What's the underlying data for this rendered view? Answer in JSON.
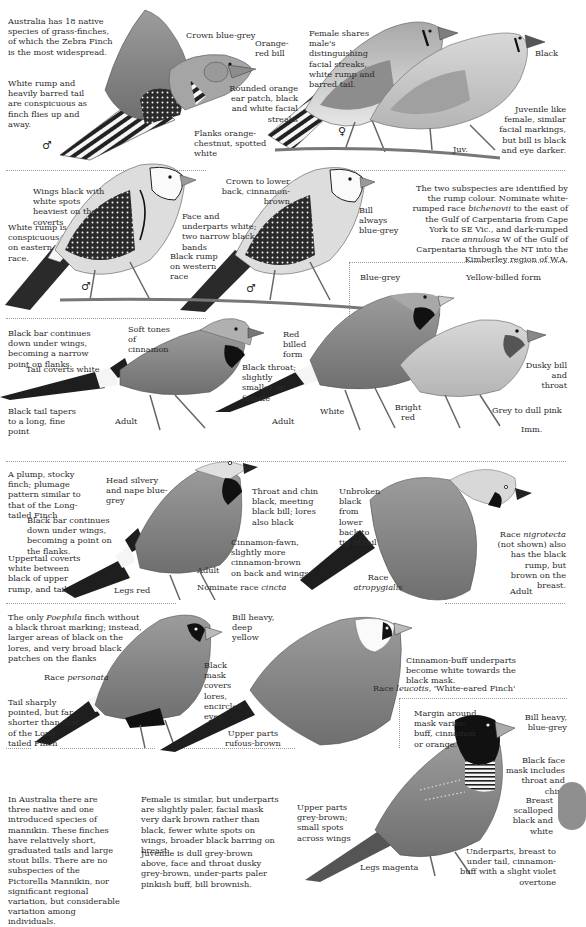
{
  "page": {
    "colors": {
      "background": "#ffffff",
      "text": "#2b2b2b",
      "divider": "#9a9a9a",
      "side_tab": "#8f8f8f",
      "ink_dark": "#1c1c1c",
      "ink_mid": "#8a8a8a",
      "ink_light": "#c9c9c9"
    }
  },
  "zebra": {
    "intro": "Australia has 18 native species of grass-finches, of which the Zebra Finch is the most widespread.",
    "rump_note": "White rump and heavily barred tail are conspicuous as finch flies up and away.",
    "crown": "Crown blue-grey",
    "bill": "Orange-red bill",
    "ear": "Rounded orange ear patch, black and white facial streaks",
    "flanks": "Flanks orange-chestnut, spotted white",
    "male_symbol": "♂",
    "female_note": "Female shares male's distinguishing facial streaks, white rump and barred tail.",
    "black": "Black",
    "juvenile_note": "Juvenile like female, similar facial markings, but bill is black and eye darker.",
    "female_symbol": "♀",
    "juv_label": "Juv."
  },
  "double_barred": {
    "wings": "Wings black with white spots heaviest on the coverts",
    "white_rump": "White rump is conspicuous on eastern race.",
    "face": "Face and underparts white; two narrow black bands",
    "black_rump": "Black rump on western race",
    "crown": "Crown to lower back, cinnamon-brown",
    "bill": "Bill always blue-grey",
    "male_symbol_1": "♂",
    "male_symbol_2": "♂",
    "subspecies_note_1": "The two subspecies are identified by the rump colour. Nominate white-rumped race ",
    "subspecies_race_1": "bichenovii",
    "subspecies_note_2": " to the east of the Gulf of Carpentaria from Cape York to SE Vic., and dark-rumped race ",
    "subspecies_race_2": "annulosa",
    "subspecies_note_3": " W of the Gulf of Carpentaria through the NT into the Kimberley region of W.A."
  },
  "long_tailed": {
    "black_bar": "Black bar continues down under wings, becoming a narrow point on flanks.",
    "soft_tones": "Soft tones of cinnamon",
    "red_billed": "Red billed form",
    "tail_coverts": "Tail coverts white",
    "black_throat": "Black throat; slightly smaller on female",
    "black_tail": "Black tail tapers to a long, fine point",
    "adult_1": "Adult",
    "blue_grey": "Blue-grey",
    "yellow_billed": "Yellow-billed form",
    "dusky": "Dusky bill and throat",
    "white": "White",
    "adult_2": "Adult",
    "bright_red": "Bright red",
    "grey_pink": "Grey to dull pink",
    "imm": "Imm."
  },
  "black_throated": {
    "intro": "A plump, stocky finch; plumage pattern similar to that of the Long-tailed Finch",
    "head": "Head silvery and nape blue-grey",
    "throat": "Throat and chin black, meeting black bill; lores also black",
    "black_bar": "Black bar continues down under wings, becoming a point on the flanks.",
    "cinnamon": "Cinnamon-fawn, slightly more cinnamon-brown on back and wings",
    "uppertail": "Uppertail coverts white between black of upper rump, and tail",
    "adult": "Adult",
    "legs": "Legs red",
    "nominate_prefix": "Nominate race ",
    "nominate_race": "cincta",
    "unbroken": "Unbroken black from lower back to tip of tail",
    "race_label": "Race",
    "race_name": "atropygialis",
    "nigrotecta_prefix": "Race ",
    "nigrotecta_name": "nigrotecta",
    "nigrotecta_note": " (not shown) also has the black rump, but brown on the breast.",
    "adult_flight": "Adult"
  },
  "masked": {
    "intro_prefix": "The only ",
    "intro_genus": "Poephila",
    "intro_rest": " finch without a black throat marking; instead, larger areas of black on the lores, and very broad black patches on the flanks",
    "bill": "Bill heavy, deep yellow",
    "race_prefix": "Race ",
    "race_name": "personata",
    "mask": "Black mask covers lores, encircles eyes.",
    "tail": "Tail sharply pointed, but far shorter than that of the Long-tailed Finch",
    "upper_parts": "Upper parts rufous-brown",
    "cinnamon_buff": "Cinnamon-buff underparts become white towards the black mask.",
    "leucotis_prefix": "Race ",
    "leucotis_name": "leucotis",
    "leucotis_rest": ", 'White-eared Finch'"
  },
  "pictorella": {
    "intro": "In Australia there are three native and one introduced species of mannikin. These finches have relatively short, graduated tails and large stout bills. There are no subspecies of the Pictorella Mannikin, nor significant regional variation, but considerable variation among individuals.",
    "female": "Female is similar, but underparts are slightly paler, facial mask very dark brown rather than black, fewer white spots on wings, broader black barring on breast.",
    "juvenile": "Juvenile is dull grey-brown above, face and throat dusky grey-brown, under-parts paler pinkish buff, bill brownish.",
    "margin": "Margin around mask varies: buff, cinnamon or orange.",
    "bill": "Bill heavy, blue-grey",
    "face_mask": "Black face mask includes throat and chin.",
    "breast": "Breast scalloped black and white",
    "upper_parts": "Upper parts grey-brown; small spots across wings",
    "underparts": "Underparts, breast to under tail, cinnamon-buff with a slight violet overtone",
    "legs": "Legs magenta"
  }
}
